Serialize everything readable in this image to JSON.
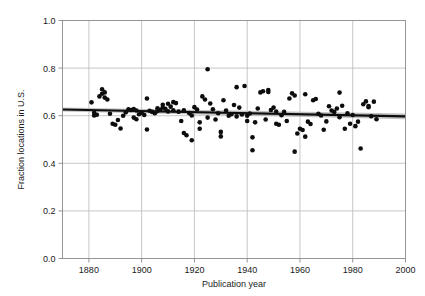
{
  "chart_data": {
    "type": "scatter",
    "title": "",
    "xlabel": "Publication year",
    "ylabel": "Fraction locations in U.S.",
    "xlim": [
      1870,
      2000
    ],
    "ylim": [
      0.0,
      1.0
    ],
    "xticks": [
      1880,
      1900,
      1920,
      1940,
      1960,
      1980,
      2000
    ],
    "xtick_labels": [
      "1880",
      "1900",
      "1920",
      "1940",
      "1960",
      "1980",
      "2000"
    ],
    "yticks": [
      0.0,
      0.2,
      0.4,
      0.6,
      0.8,
      1.0
    ],
    "ytick_labels": [
      "0.0",
      "0.2",
      "0.4",
      "0.6",
      "0.8",
      "1.0"
    ],
    "grid": true,
    "legend": "none",
    "marker_color": "#0d0d0d",
    "marker_size": 4.6,
    "fit_line_color": "#0d0d0d",
    "fit_band_color": "#b4b4b4",
    "fit_line": {
      "x": [
        1870,
        2000
      ],
      "y": [
        0.626,
        0.597
      ],
      "band_upper": [
        0.634,
        0.609
      ],
      "band_lower": [
        0.618,
        0.585
      ]
    },
    "points": [
      [
        1881,
        0.656
      ],
      [
        1882,
        0.612
      ],
      [
        1882,
        0.601
      ],
      [
        1883,
        0.604
      ],
      [
        1884,
        0.681
      ],
      [
        1885,
        0.711
      ],
      [
        1885,
        0.692
      ],
      [
        1886,
        0.698
      ],
      [
        1886,
        0.676
      ],
      [
        1887,
        0.668
      ],
      [
        1888,
        0.608
      ],
      [
        1889,
        0.566
      ],
      [
        1890,
        0.562
      ],
      [
        1891,
        0.582
      ],
      [
        1892,
        0.546
      ],
      [
        1893,
        0.6
      ],
      [
        1894,
        0.614
      ],
      [
        1895,
        0.627
      ],
      [
        1896,
        0.624
      ],
      [
        1897,
        0.592
      ],
      [
        1897,
        0.628
      ],
      [
        1898,
        0.585
      ],
      [
        1898,
        0.622
      ],
      [
        1899,
        0.606
      ],
      [
        1900,
        0.612
      ],
      [
        1901,
        0.603
      ],
      [
        1902,
        0.672
      ],
      [
        1902,
        0.542
      ],
      [
        1903,
        0.621
      ],
      [
        1904,
        0.616
      ],
      [
        1905,
        0.61
      ],
      [
        1906,
        0.631
      ],
      [
        1906,
        0.62
      ],
      [
        1907,
        0.625
      ],
      [
        1908,
        0.646
      ],
      [
        1908,
        0.634
      ],
      [
        1909,
        0.629
      ],
      [
        1910,
        0.65
      ],
      [
        1910,
        0.618
      ],
      [
        1911,
        0.638
      ],
      [
        1912,
        0.657
      ],
      [
        1912,
        0.623
      ],
      [
        1913,
        0.653
      ],
      [
        1914,
        0.617
      ],
      [
        1915,
        0.578
      ],
      [
        1916,
        0.623
      ],
      [
        1916,
        0.527
      ],
      [
        1917,
        0.518
      ],
      [
        1918,
        0.611
      ],
      [
        1919,
        0.601
      ],
      [
        1919,
        0.497
      ],
      [
        1920,
        0.636
      ],
      [
        1921,
        0.626
      ],
      [
        1922,
        0.545
      ],
      [
        1922,
        0.572
      ],
      [
        1923,
        0.681
      ],
      [
        1924,
        0.668
      ],
      [
        1925,
        0.592
      ],
      [
        1925,
        0.795
      ],
      [
        1926,
        0.651
      ],
      [
        1927,
        0.627
      ],
      [
        1928,
        0.584
      ],
      [
        1929,
        0.61
      ],
      [
        1930,
        0.532
      ],
      [
        1930,
        0.513
      ],
      [
        1931,
        0.665
      ],
      [
        1932,
        0.622
      ],
      [
        1933,
        0.6
      ],
      [
        1934,
        0.606
      ],
      [
        1935,
        0.645
      ],
      [
        1936,
        0.597
      ],
      [
        1936,
        0.72
      ],
      [
        1937,
        0.634
      ],
      [
        1938,
        0.605
      ],
      [
        1939,
        0.725
      ],
      [
        1940,
        0.578
      ],
      [
        1940,
        0.6
      ],
      [
        1941,
        0.609
      ],
      [
        1942,
        0.509
      ],
      [
        1942,
        0.455
      ],
      [
        1943,
        0.572
      ],
      [
        1944,
        0.63
      ],
      [
        1945,
        0.698
      ],
      [
        1946,
        0.703
      ],
      [
        1947,
        0.584
      ],
      [
        1948,
        0.708
      ],
      [
        1948,
        0.7
      ],
      [
        1949,
        0.624
      ],
      [
        1950,
        0.634
      ],
      [
        1951,
        0.617
      ],
      [
        1951,
        0.566
      ],
      [
        1952,
        0.562
      ],
      [
        1953,
        0.602
      ],
      [
        1954,
        0.616
      ],
      [
        1955,
        0.578
      ],
      [
        1956,
        0.672
      ],
      [
        1957,
        0.694
      ],
      [
        1958,
        0.449
      ],
      [
        1958,
        0.685
      ],
      [
        1959,
        0.525
      ],
      [
        1960,
        0.545
      ],
      [
        1961,
        0.54
      ],
      [
        1962,
        0.69
      ],
      [
        1962,
        0.512
      ],
      [
        1963,
        0.575
      ],
      [
        1964,
        0.565
      ],
      [
        1965,
        0.665
      ],
      [
        1966,
        0.67
      ],
      [
        1967,
        0.608
      ],
      [
        1968,
        0.601
      ],
      [
        1969,
        0.541
      ],
      [
        1970,
        0.576
      ],
      [
        1971,
        0.64
      ],
      [
        1972,
        0.622
      ],
      [
        1973,
        0.616
      ],
      [
        1974,
        0.63
      ],
      [
        1975,
        0.697
      ],
      [
        1975,
        0.594
      ],
      [
        1976,
        0.642
      ],
      [
        1977,
        0.545
      ],
      [
        1978,
        0.61
      ],
      [
        1979,
        0.566
      ],
      [
        1980,
        0.603
      ],
      [
        1981,
        0.556
      ],
      [
        1982,
        0.575
      ],
      [
        1983,
        0.462
      ],
      [
        1984,
        0.648
      ],
      [
        1985,
        0.66
      ],
      [
        1986,
        0.636
      ],
      [
        1986,
        0.641
      ],
      [
        1987,
        0.598
      ],
      [
        1988,
        0.659
      ],
      [
        1989,
        0.585
      ]
    ]
  }
}
